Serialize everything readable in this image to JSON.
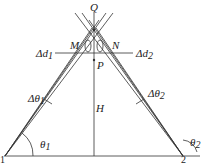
{
  "diagram": {
    "labels": {
      "Q": "Q",
      "M": "M",
      "N": "N",
      "P": "P",
      "H": "H",
      "dd1": "Δd",
      "dd1_sub": "1",
      "dd2": "Δd",
      "dd2_sub": "2",
      "dt1": "Δθ",
      "dt1_sub": "1",
      "dt2": "Δθ",
      "dt2_sub": "2",
      "t1": "θ",
      "t1_sub": "1",
      "t2": "θ",
      "t2_sub": "2",
      "p1": "1",
      "p2": "2"
    },
    "colors": {
      "line": "#333333",
      "text": "#222222"
    }
  }
}
